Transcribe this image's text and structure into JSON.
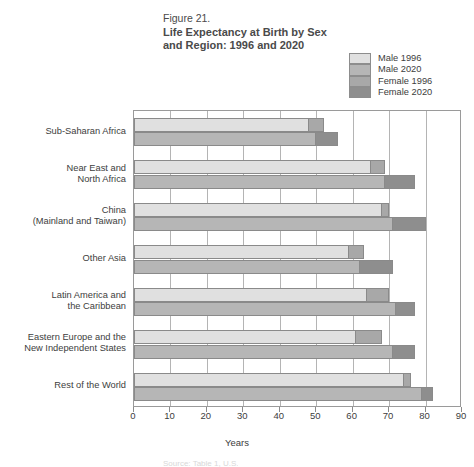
{
  "figure": {
    "number": "Figure 21.",
    "title_line1": "Life Expectancy at Birth by Sex",
    "title_line2": "and Region:  1996 and 2020",
    "axis_title": "Years",
    "source_note": "Source: Table 1, U.S."
  },
  "legend": {
    "items": [
      {
        "label": "Male 1996",
        "color": "#e0e0e0"
      },
      {
        "label": "Male 2020",
        "color": "#b6b6b6"
      },
      {
        "label": "Female 1996",
        "color": "#a8a8a8"
      },
      {
        "label": "Female 2020",
        "color": "#8e8e8e"
      }
    ]
  },
  "chart_data": {
    "type": "bar",
    "orientation": "horizontal",
    "title": "Life Expectancy at Birth by Sex and Region:  1996 and 2020",
    "xlabel": "Years",
    "ylabel": "",
    "xlim": [
      0,
      90
    ],
    "xticks": [
      0,
      10,
      20,
      30,
      40,
      50,
      60,
      70,
      80,
      90
    ],
    "grid": true,
    "legend_position": "top-right",
    "categories": [
      "Sub-Saharan Africa",
      "Near East and North Africa",
      "China (Mainland and Taiwan)",
      "Other Asia",
      "Latin America and the Caribbean",
      "Eastern Europe and the New Independent States",
      "Rest of the World"
    ],
    "series": [
      {
        "name": "Male 1996",
        "values": [
          48,
          65,
          68,
          59,
          64,
          61,
          74
        ]
      },
      {
        "name": "Female 1996",
        "values": [
          52,
          69,
          70,
          63,
          70,
          68,
          76
        ]
      },
      {
        "name": "Male 2020",
        "values": [
          50,
          69,
          71,
          62,
          72,
          71,
          79
        ]
      },
      {
        "name": "Female 2020",
        "values": [
          56,
          77,
          80,
          71,
          77,
          77,
          82
        ]
      }
    ]
  },
  "categories_display": [
    {
      "lines": [
        "Sub-Saharan Africa"
      ]
    },
    {
      "lines": [
        "Near East and",
        "North Africa"
      ]
    },
    {
      "lines": [
        "China",
        "(Mainland and Taiwan)"
      ]
    },
    {
      "lines": [
        "Other Asia"
      ]
    },
    {
      "lines": [
        "Latin America and",
        "the Caribbean"
      ]
    },
    {
      "lines": [
        "Eastern Europe and the",
        "New Independent States"
      ]
    },
    {
      "lines": [
        "Rest of the World"
      ]
    }
  ]
}
